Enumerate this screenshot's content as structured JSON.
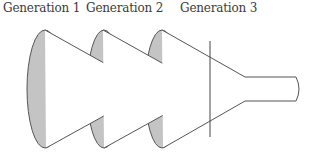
{
  "labels": {
    "gen1": "Generation 1",
    "gen2": "Generation 2",
    "gen3": "Generation 3"
  },
  "colors": {
    "ellipse_fill": "#c4c4c4",
    "stroke": "#555555",
    "cone_fill": "#ffffff",
    "text": "#3a3a3a"
  }
}
